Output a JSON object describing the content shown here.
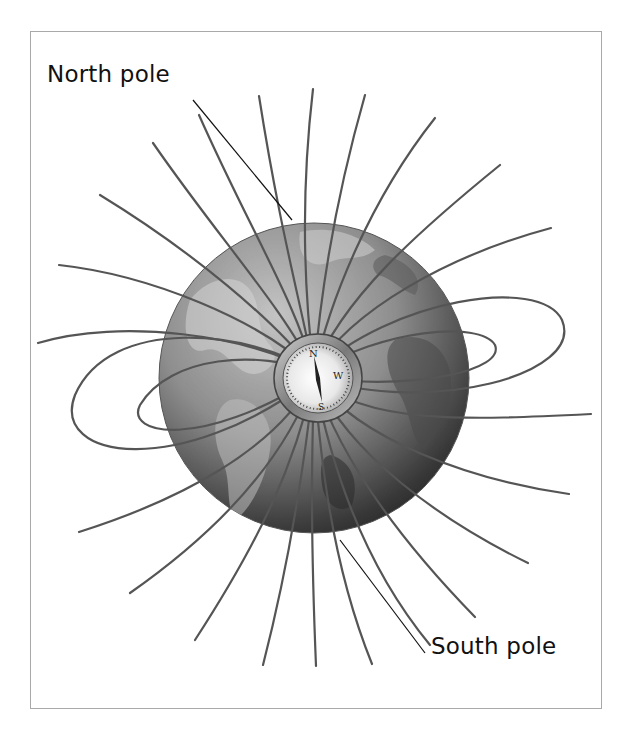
{
  "diagram": {
    "labels": {
      "north": "North pole",
      "south": "South pole"
    },
    "compass": {
      "visible_letters": [
        "N",
        "W",
        "S"
      ]
    },
    "colors": {
      "field_line": "#555555",
      "leader_line": "#111111",
      "frame": "#a9a9a9",
      "globe_light": "#b5b5b5",
      "globe_dark": "#1e1e1e"
    }
  }
}
